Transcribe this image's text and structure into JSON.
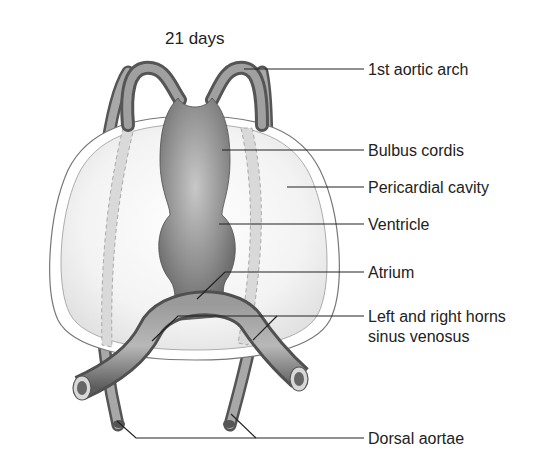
{
  "title": "21 days",
  "labels": {
    "aortic_arch": "1st aortic arch",
    "bulbus_cordis": "Bulbus cordis",
    "pericardial_cavity": "Pericardial cavity",
    "ventricle": "Ventricle",
    "atrium": "Atrium",
    "sinus_line1": "Left and right horns",
    "sinus_line2": "sinus venosus",
    "dorsal_aortae": "Dorsal aortae"
  },
  "colors": {
    "tube_dark": "#5a5a5a",
    "tube_mid": "#8a8a8a",
    "tube_light": "#c4c4c4",
    "cavity_fill": "#eeeeee",
    "cavity_band": "#d6d6d6",
    "leader": "#222222"
  }
}
